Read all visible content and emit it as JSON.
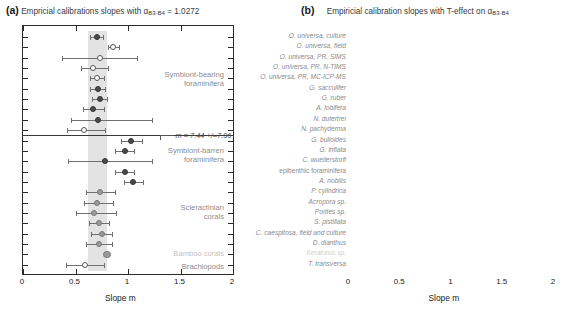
{
  "figure": {
    "width": 573,
    "height": 317,
    "axis_title": "Slope m",
    "x_ticks": [
      "0",
      "0.5",
      "1",
      "1.5",
      "2"
    ],
    "x_tick_values": [
      0,
      0.5,
      1,
      1.5,
      2
    ],
    "xlim": [
      0,
      2
    ]
  },
  "panels": {
    "a": {
      "tag": "(a)",
      "title_pre": "Empricial calibrations slopes with ",
      "title_symbol": "α",
      "title_sub": "B3-B4",
      "title_post": " = 1.0272",
      "annotation": {
        "text": "m = 7.44 +/–7.96",
        "value": 7.44,
        "error": 7.96
      },
      "group_labels": [
        {
          "label": "Symbiont-bearing\nforaminifera",
          "dim": false
        },
        {
          "label": "Symbiont-barren\nforaminifera",
          "dim": false
        },
        {
          "label": "Scleractinian\ncorals",
          "dim": false
        },
        {
          "label": "Bamboo corals",
          "dim": true
        },
        {
          "label": "Brachiopods",
          "dim": false
        }
      ]
    },
    "b": {
      "tag": "(b)",
      "title_pre": "Empiricial calibration slopes with T-effect on ",
      "title_symbol": "α",
      "title_sub": "B3-B4",
      "title_post": "",
      "annotation": {
        "text": "m = 2.41 +/–1.17",
        "value": 2.41,
        "error": 1.17
      }
    }
  },
  "species": [
    {
      "name": "O. universa, culture",
      "style": "italic"
    },
    {
      "name": "O. universa, field",
      "style": "italic"
    },
    {
      "name": "O. universa, PR, SIMS",
      "style": "italic"
    },
    {
      "name": "O. universa, PR, N-TIMS",
      "style": "italic"
    },
    {
      "name": "O. universa, PR, MC-ICP-MS",
      "style": "italic"
    },
    {
      "name": "G. sacculifer",
      "style": "italic"
    },
    {
      "name": "G. ruber",
      "style": "italic"
    },
    {
      "name": "A. lobifera",
      "style": "italic"
    },
    {
      "name": "N. dutertrei",
      "style": "italic"
    },
    {
      "name": "N. pachyderma",
      "style": "italic"
    },
    {
      "name": "G. bulloides",
      "style": "italic"
    },
    {
      "name": "G. inflata",
      "style": "italic"
    },
    {
      "name": "C. wuellerstorfi",
      "style": "italic"
    },
    {
      "name": "epibenthic foraminifera",
      "style": "upright"
    },
    {
      "name": "A. nobilis",
      "style": "italic"
    },
    {
      "name": "P. cylindrica",
      "style": "italic"
    },
    {
      "name": "Acropora sp.",
      "style": "italic"
    },
    {
      "name": "Porites sp.",
      "style": "italic"
    },
    {
      "name": "S. pistillata",
      "style": "italic"
    },
    {
      "name": "C. caespitosa, field and culture",
      "style": "italic"
    },
    {
      "name": "D. dianthus",
      "style": "italic"
    },
    {
      "name": "Keratoisis sp.",
      "style": "faint"
    },
    {
      "name": "T. transversa",
      "style": "italic"
    }
  ],
  "chart_data": {
    "type": "scatter",
    "orientation": "horizontal-errorbar-forest",
    "xlabel": "Slope m",
    "ylabel": "",
    "xlim": [
      0,
      2
    ],
    "xticks": [
      0,
      0.5,
      1,
      1.5,
      2
    ],
    "grid": false,
    "legend": "none",
    "categories": [
      "O. universa, culture",
      "O. universa, field",
      "O. universa, PR, SIMS",
      "O. universa, PR, N-TIMS",
      "O. universa, PR, MC-ICP-MS",
      "G. sacculifer",
      "G. ruber",
      "A. lobifera",
      "N. dutertrei",
      "N. pachyderma",
      "G. bulloides",
      "G. inflata",
      "C. wuellerstorfi",
      "epibenthic foraminifera",
      "A. nobilis",
      "P. cylindrica",
      "Acropora sp.",
      "Porites sp.",
      "S. pistillata",
      "C. caespitosa, field and culture",
      "D. dianthus",
      "Keratoisis sp.",
      "T. transversa"
    ],
    "series": [
      {
        "name": "Panel (a): slopes with constant alpha_B3-B4 = 1.0272",
        "panel": "a",
        "shading_band": [
          0.62,
          0.8
        ],
        "points": [
          {
            "category": "O. universa, culture",
            "value": 0.7,
            "err_low": 0.06,
            "err_high": 0.06,
            "marker": "dark"
          },
          {
            "category": "O. universa, field",
            "value": 0.86,
            "err_low": 0.05,
            "err_high": 0.05,
            "marker": "open"
          },
          {
            "category": "O. universa, PR, SIMS",
            "value": 0.73,
            "err_low": 0.36,
            "err_high": 0.36,
            "marker": "open"
          },
          {
            "category": "O. universa, PR, N-TIMS",
            "value": 0.67,
            "err_low": 0.12,
            "err_high": 0.14,
            "marker": "open"
          },
          {
            "category": "O. universa, PR, MC-ICP-MS",
            "value": 0.7,
            "err_low": 0.06,
            "err_high": 0.07,
            "marker": "open"
          },
          {
            "category": "G. sacculifer",
            "value": 0.71,
            "err_low": 0.07,
            "err_high": 0.07,
            "marker": "dark"
          },
          {
            "category": "G. ruber",
            "value": 0.73,
            "err_low": 0.07,
            "err_high": 0.07,
            "marker": "dark"
          },
          {
            "category": "A. lobifera",
            "value": 0.67,
            "err_low": 0.1,
            "err_high": 0.1,
            "marker": "dark"
          },
          {
            "category": "N. dutertrei",
            "value": 0.71,
            "err_low": 0.25,
            "err_high": 0.52,
            "marker": "dark"
          },
          {
            "category": "N. pachyderma",
            "value": 0.58,
            "err_low": 0.16,
            "err_high": 0.2,
            "marker": "open"
          },
          {
            "category": "G. bulloides",
            "value": 1.03,
            "err_low": 0.1,
            "err_high": 0.1,
            "marker": "dark"
          },
          {
            "category": "G. inflata",
            "value": 0.97,
            "err_low": 0.09,
            "err_high": 0.09,
            "marker": "dark"
          },
          {
            "category": "C. wuellerstorfi",
            "value": 0.78,
            "err_low": 0.35,
            "err_high": 0.45,
            "marker": "dark"
          },
          {
            "category": "epibenthic foraminifera",
            "value": 0.97,
            "err_low": 0.09,
            "err_high": 0.09,
            "marker": "dark"
          },
          {
            "category": "A. nobilis",
            "value": 1.05,
            "err_low": 0.09,
            "err_high": 0.09,
            "marker": "dark"
          },
          {
            "category": "P. cylindrica",
            "value": 0.73,
            "err_low": 0.13,
            "err_high": 0.15,
            "marker": "mid"
          },
          {
            "category": "Acropora sp.",
            "value": 0.7,
            "err_low": 0.12,
            "err_high": 0.16,
            "marker": "mid"
          },
          {
            "category": "Porites sp.",
            "value": 0.68,
            "err_low": 0.18,
            "err_high": 0.21,
            "marker": "mid"
          },
          {
            "category": "S. pistillata",
            "value": 0.72,
            "err_low": 0.09,
            "err_high": 0.1,
            "marker": "mid"
          },
          {
            "category": "C. caespitosa, field and culture",
            "value": 0.75,
            "err_low": 0.1,
            "err_high": 0.1,
            "marker": "mid"
          },
          {
            "category": "D. dianthus",
            "value": 0.72,
            "err_low": 0.12,
            "err_high": 0.13,
            "marker": "mid"
          },
          {
            "category": "Keratoisis sp.",
            "value": 0.8,
            "err_low": 0.0,
            "err_high": 0.0,
            "marker": "mid-big"
          },
          {
            "category": "T. transversa",
            "value": 0.59,
            "err_low": 0.18,
            "err_high": 0.18,
            "marker": "open"
          }
        ]
      },
      {
        "name": "Panel (b): slopes with T-effect on alpha_B3-B4",
        "panel": "b",
        "shading_band": [
          0.64,
          0.82
        ],
        "points": [
          {
            "category": "O. universa, culture",
            "value": 0.71,
            "err_low": 0.06,
            "err_high": 0.06,
            "marker": "dark"
          },
          {
            "category": "O. universa, field",
            "value": 0.75,
            "err_low": 0.05,
            "err_high": 0.05,
            "marker": "dark"
          },
          {
            "category": "O. universa, PR, SIMS",
            "value": 0.83,
            "err_low": 0.35,
            "err_high": 0.33,
            "marker": "open"
          },
          {
            "category": "O. universa, PR, N-TIMS",
            "value": 0.69,
            "err_low": 0.12,
            "err_high": 0.14,
            "marker": "open"
          },
          {
            "category": "O. universa, PR, MC-ICP-MS",
            "value": 0.74,
            "err_low": 0.06,
            "err_high": 0.07,
            "marker": "open"
          },
          {
            "category": "G. sacculifer",
            "value": 0.73,
            "err_low": 0.07,
            "err_high": 0.07,
            "marker": "dark"
          },
          {
            "category": "G. ruber",
            "value": 0.76,
            "err_low": 0.07,
            "err_high": 0.07,
            "marker": "dark"
          },
          {
            "category": "A. lobifera",
            "value": 0.66,
            "err_low": 0.09,
            "err_high": 0.09,
            "marker": "dark"
          },
          {
            "category": "N. dutertrei",
            "value": 0.73,
            "err_low": 0.28,
            "err_high": 0.56,
            "marker": "dark"
          },
          {
            "category": "N. pachyderma",
            "value": 0.5,
            "err_low": 0.13,
            "err_high": 0.2,
            "marker": "open"
          },
          {
            "category": "G. bulloides",
            "value": 0.81,
            "err_low": 0.09,
            "err_high": 0.09,
            "marker": "dark"
          },
          {
            "category": "G. inflata",
            "value": 0.94,
            "err_low": 0.08,
            "err_high": 0.08,
            "marker": "dark"
          },
          {
            "category": "C. wuellerstorfi",
            "value": 0.82,
            "err_low": 0.35,
            "err_high": 0.45,
            "marker": "dark"
          },
          {
            "category": "epibenthic foraminifera",
            "value": 0.75,
            "err_low": 0.08,
            "err_high": 0.08,
            "marker": "dark"
          },
          {
            "category": "A. nobilis",
            "value": 0.76,
            "err_low": 0.06,
            "err_high": 0.06,
            "marker": "dark"
          },
          {
            "category": "P. cylindrica",
            "value": 0.8,
            "err_low": 0.14,
            "err_high": 0.14,
            "marker": "mid"
          },
          {
            "category": "Acropora sp.",
            "value": 0.76,
            "err_low": 0.13,
            "err_high": 0.16,
            "marker": "mid"
          },
          {
            "category": "Porites sp.",
            "value": 0.73,
            "err_low": 0.18,
            "err_high": 0.21,
            "marker": "mid"
          },
          {
            "category": "S. pistillata",
            "value": 0.78,
            "err_low": 0.09,
            "err_high": 0.09,
            "marker": "mid"
          },
          {
            "category": "C. caespitosa, field and culture",
            "value": 0.78,
            "err_low": 0.1,
            "err_high": 0.1,
            "marker": "mid"
          },
          {
            "category": "D. dianthus",
            "value": 0.7,
            "err_low": 0.12,
            "err_high": 0.13,
            "marker": "mid"
          },
          {
            "category": "Keratoisis sp.",
            "value": 0.91,
            "err_low": 0.0,
            "err_high": 0.0,
            "marker": "mid-big"
          },
          {
            "category": "T. transversa",
            "value": 0.48,
            "err_low": 0.14,
            "err_high": 0.14,
            "marker": "open"
          }
        ]
      }
    ],
    "annotations": [
      {
        "panel": "a",
        "text": "m = 7.44 +/–7.96",
        "category": "N. pachyderma"
      },
      {
        "panel": "b",
        "text": "m = 2.41 +/–1.17",
        "category": "N. pachyderma"
      }
    ]
  }
}
